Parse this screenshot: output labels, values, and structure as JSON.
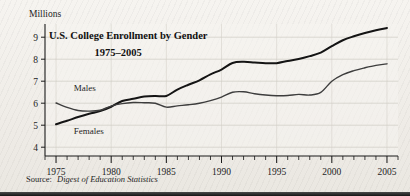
{
  "figure": {
    "unit_label": "Millions",
    "title": "U.S. College Enrollment by Gender",
    "subtitle": "1975–2005",
    "source_prefix": "Source:",
    "source_name": "Digest of Education Statistics"
  },
  "colors": {
    "page_background": "#f2f0ec",
    "plot_background": "#f6f4f0",
    "axis": "#1b1b1b",
    "grid": "#cfcbc4",
    "series_females": "#141414",
    "series_males": "#3d3d3d",
    "bottom_bar": "#1a1a1a"
  },
  "chart_data": {
    "type": "line",
    "title": "U.S. College Enrollment by Gender",
    "subtitle": "1975–2005",
    "xlabel": "",
    "ylabel": "Millions",
    "xlim": [
      1974,
      2006
    ],
    "ylim": [
      3.6,
      9.6
    ],
    "yticks": [
      4,
      5,
      6,
      7,
      8,
      9
    ],
    "ytick_labels": [
      "4",
      "5",
      "6",
      "7",
      "8",
      "9"
    ],
    "xticks": [
      1975,
      1980,
      1985,
      1990,
      1995,
      2000,
      2005
    ],
    "xtick_labels": [
      "1975",
      "1980",
      "1985",
      "1990",
      "1995",
      "2000",
      "2005"
    ],
    "xtick_minor_step": 1,
    "grid": "horizontal",
    "legend": "inline-labels",
    "annotations": [
      {
        "text": "Males",
        "x": 1976.6,
        "y": 6.55,
        "anchor": "start"
      },
      {
        "text": "Females",
        "x": 1976.6,
        "y": 4.62,
        "anchor": "start"
      }
    ],
    "x": [
      1975,
      1976,
      1977,
      1978,
      1979,
      1980,
      1981,
      1982,
      1983,
      1984,
      1985,
      1986,
      1987,
      1988,
      1989,
      1990,
      1991,
      1992,
      1993,
      1994,
      1995,
      1996,
      1997,
      1998,
      1999,
      2000,
      2001,
      2002,
      2003,
      2004,
      2005
    ],
    "series": [
      {
        "name": "Females",
        "values": [
          5.04,
          5.2,
          5.37,
          5.52,
          5.64,
          5.84,
          6.1,
          6.2,
          6.3,
          6.33,
          6.33,
          6.62,
          6.84,
          7.04,
          7.31,
          7.53,
          7.83,
          7.88,
          7.85,
          7.82,
          7.82,
          7.92,
          8.01,
          8.14,
          8.3,
          8.59,
          8.86,
          9.04,
          9.19,
          9.32,
          9.42
        ]
      },
      {
        "name": "Males",
        "values": [
          6.01,
          5.81,
          5.67,
          5.64,
          5.68,
          5.87,
          5.98,
          6.03,
          6.02,
          6.0,
          5.82,
          5.88,
          5.93,
          6.0,
          6.12,
          6.28,
          6.5,
          6.52,
          6.43,
          6.37,
          6.34,
          6.35,
          6.4,
          6.37,
          6.49,
          7.0,
          7.3,
          7.48,
          7.61,
          7.72,
          7.79
        ]
      }
    ]
  }
}
